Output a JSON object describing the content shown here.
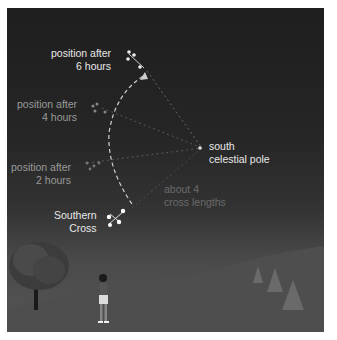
{
  "diagram": {
    "labels": {
      "after6_line1": "position after",
      "after6_line2": "6 hours",
      "after4_line1": "position after",
      "after4_line2": "4 hours",
      "after2_line1": "position after",
      "after2_line2": "2 hours",
      "pole_line1": "south",
      "pole_line2": "celestial pole",
      "distance_line1": "about 4",
      "distance_line2": "cross lengths",
      "cross_line1": "Southern",
      "cross_line2": "Cross"
    },
    "colors": {
      "sky": "#222222",
      "ground": "#505050",
      "bright_text": "#e8e8e8",
      "dim_text": "#9a9a9a",
      "faint_text": "#6a6a6a"
    }
  }
}
